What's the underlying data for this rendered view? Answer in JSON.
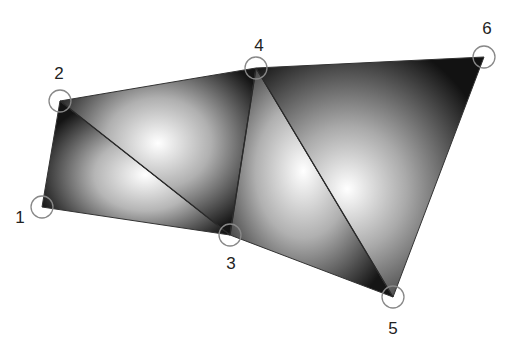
{
  "diagram": {
    "vertices": [
      {
        "id": 1,
        "label": "1",
        "x": 42,
        "y": 207,
        "lx": 20,
        "ly": 223
      },
      {
        "id": 2,
        "label": "2",
        "x": 60,
        "y": 101,
        "lx": 59,
        "ly": 79
      },
      {
        "id": 3,
        "label": "3",
        "x": 230,
        "y": 235,
        "lx": 231,
        "ly": 269
      },
      {
        "id": 4,
        "label": "4",
        "x": 256,
        "y": 68,
        "lx": 259,
        "ly": 51
      },
      {
        "id": 5,
        "label": "5",
        "x": 393,
        "y": 297,
        "lx": 393,
        "ly": 334
      },
      {
        "id": 6,
        "label": "6",
        "x": 484,
        "y": 57,
        "lx": 487,
        "ly": 34
      }
    ],
    "triangles": [
      [
        1,
        2,
        3
      ],
      [
        2,
        3,
        4
      ],
      [
        3,
        4,
        5
      ],
      [
        4,
        5,
        6
      ]
    ],
    "colors": {
      "fill_dark": "#111111",
      "fill_light": "#ffffff",
      "edge": "#333333",
      "vertex_circle": "#888888",
      "label": "#222222"
    },
    "vertex_circle_radius": 11
  }
}
